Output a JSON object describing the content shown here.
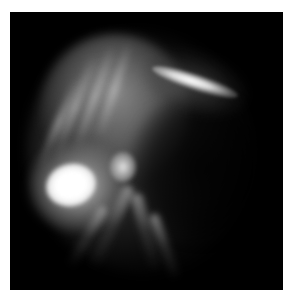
{
  "image": {
    "description": "Grayscale emission/fluorescence photograph of a diffuse glowing structure on black background",
    "colors": {
      "page_background": "#ffffff",
      "frame_background": "#000000",
      "highlight": "#ffffff"
    },
    "regions": [
      {
        "name": "upper-left streaky lobe",
        "intensity": "medium-bright"
      },
      {
        "name": "right bright crescent streak",
        "intensity": "bright"
      },
      {
        "name": "lower-left saturated blob",
        "intensity": "saturated"
      },
      {
        "name": "descending tendrils",
        "intensity": "dim"
      },
      {
        "name": "dark central region",
        "intensity": "dark"
      }
    ]
  }
}
